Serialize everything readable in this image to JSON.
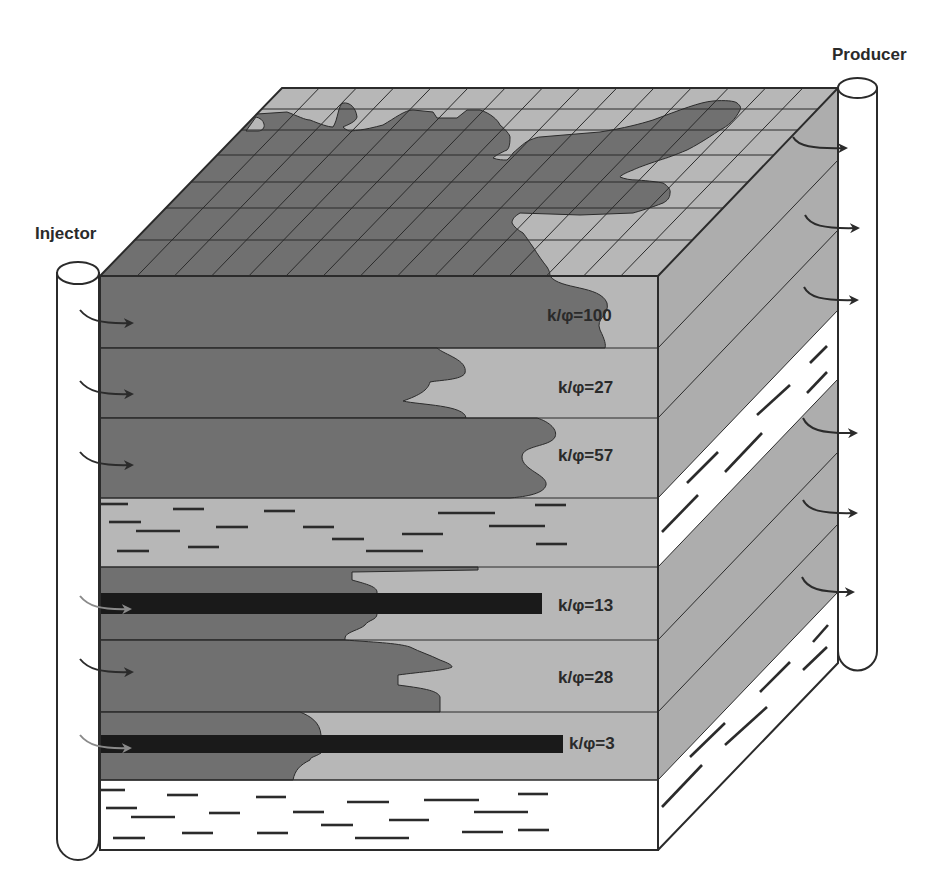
{
  "wells": {
    "injector": {
      "label": "Injector"
    },
    "producer": {
      "label": "Producer"
    }
  },
  "layers": [
    {
      "index": 1,
      "type": "reservoir",
      "k_phi": 100,
      "label": "k/φ=100",
      "barrier": false
    },
    {
      "index": 2,
      "type": "reservoir",
      "k_phi": 27,
      "label": "k/φ=27",
      "barrier": false
    },
    {
      "index": 3,
      "type": "reservoir",
      "k_phi": 57,
      "label": "k/φ=57",
      "barrier": false
    },
    {
      "index": 4,
      "type": "shale",
      "k_phi": null,
      "label": "",
      "barrier": false
    },
    {
      "index": 5,
      "type": "reservoir",
      "k_phi": 13,
      "label": "k/φ=13",
      "barrier": true
    },
    {
      "index": 6,
      "type": "reservoir",
      "k_phi": 28,
      "label": "k/φ=28",
      "barrier": false
    },
    {
      "index": 7,
      "type": "reservoir",
      "k_phi": 3,
      "label": "k/φ=3",
      "barrier": true
    },
    {
      "index": 8,
      "type": "shale",
      "k_phi": null,
      "label": "",
      "barrier": false
    }
  ],
  "flow": {
    "injector_arrows": 6,
    "producer_arrows": 6
  },
  "grid": {
    "top_face_rows": 7,
    "top_face_columns": 15
  },
  "colors": {
    "swept_fluid": "#707070",
    "unswept_rock": "#b7b7b7",
    "side_face": "#adadad",
    "shale_side": "#ffffff",
    "barrier": "#1a1a1a",
    "outline": "#2b2b2b"
  }
}
